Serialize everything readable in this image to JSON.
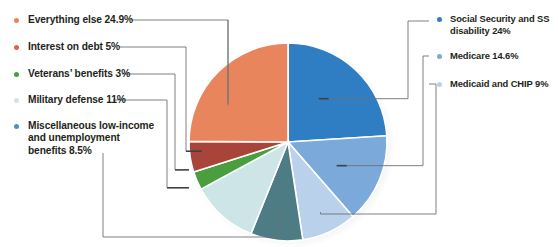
{
  "chart_data": {
    "type": "pie",
    "title": "",
    "legend_position": "sides",
    "units": "percent",
    "start_angle_deg": 0,
    "direction": "clockwise",
    "categories": [
      "Social Security and SS disability",
      "Medicare",
      "Medicaid and CHIP",
      "Miscellaneous low-income and unemployment benefits",
      "Military defense",
      "Veterans' benefits",
      "Interest on debt",
      "Everything else"
    ],
    "values": [
      24,
      14.6,
      9,
      8.5,
      11,
      3,
      5,
      24.9
    ],
    "colors": [
      "#2f7dc2",
      "#7ba9d9",
      "#b9d1ea",
      "#4e7c84",
      "#cee5e7",
      "#4a9e3f",
      "#a8443a",
      "#e8855c"
    ]
  },
  "legend": {
    "left": [
      {
        "name": "everything-else",
        "lines": [
          "Everything else 24.9%"
        ],
        "color": "#e8855c",
        "value": 24.9
      },
      {
        "name": "interest-on-debt",
        "lines": [
          "Interest on debt 5%"
        ],
        "color": "#e0634a",
        "value": 5
      },
      {
        "name": "veterans-benefits",
        "lines": [
          "Veterans’ benefits 3%"
        ],
        "color": "#4a9e3f",
        "value": 3
      },
      {
        "name": "military-defense",
        "lines": [
          "Military defense 11%"
        ],
        "color": "#cee5e7",
        "value": 11
      },
      {
        "name": "miscellaneous-benefits",
        "lines": [
          "Miscellaneous low-income",
          "and unemployment",
          "benefits 8.5%"
        ],
        "color": "#4a90c4",
        "value": 8.5
      }
    ],
    "right": [
      {
        "name": "social-security",
        "lines": [
          "Social Security and SS",
          "disability 24%"
        ],
        "color": "#2f7dc2",
        "value": 24
      },
      {
        "name": "medicare",
        "lines": [
          "Medicare 14.6%"
        ],
        "color": "#7ba9d9",
        "value": 14.6
      },
      {
        "name": "medicaid-chip",
        "lines": [
          "Medicaid and CHIP 9%"
        ],
        "color": "#b9d1ea",
        "value": 9
      }
    ]
  }
}
